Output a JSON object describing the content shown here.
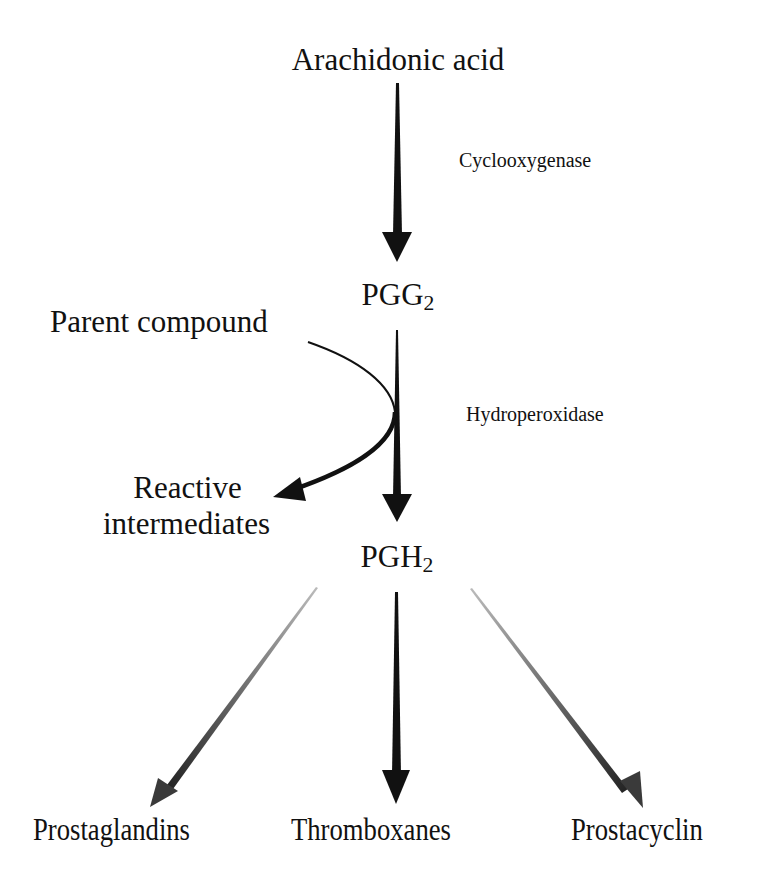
{
  "diagram": {
    "nodes": {
      "arachidonic_acid": "Arachidonic acid",
      "pgg2": {
        "base": "PGG",
        "sub": "2"
      },
      "parent_compound": "Parent compound",
      "reactive_intermediates": [
        "Reactive",
        "intermediates"
      ],
      "pgh2": {
        "base": "PGH",
        "sub": "2"
      },
      "prostaglandins": "Prostaglandins",
      "thromboxanes": "Thromboxanes",
      "prostacyclin": "Prostacyclin"
    },
    "enzymes": {
      "cyclooxygenase": "Cyclooxygenase",
      "hydroperoxidase": "Hydroperoxidase"
    },
    "edges": [
      {
        "from": "Arachidonic acid",
        "to": "PGG2",
        "label": "Cyclooxygenase"
      },
      {
        "from": "PGG2",
        "to": "PGH2",
        "label": "Hydroperoxidase"
      },
      {
        "from": "Parent compound",
        "to": "Reactive intermediates",
        "label": ""
      },
      {
        "from": "PGH2",
        "to": "Prostaglandins",
        "label": ""
      },
      {
        "from": "PGH2",
        "to": "Thromboxanes",
        "label": ""
      },
      {
        "from": "PGH2",
        "to": "Prostacyclin",
        "label": ""
      }
    ],
    "colors": {
      "ink": "#111111",
      "gray_arrow": "#3a3a3a",
      "background": "#ffffff"
    }
  }
}
